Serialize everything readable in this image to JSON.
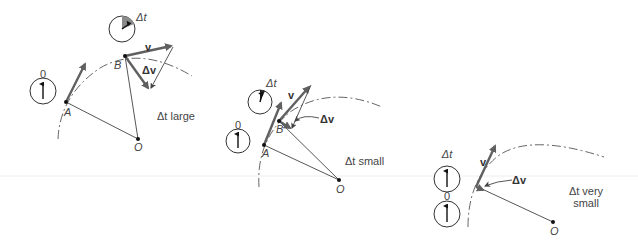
{
  "colors": {
    "vector": "#606060",
    "line": "#444444",
    "sector": "#8a8a8a",
    "text": "#444444"
  },
  "panels": [
    {
      "id": "large",
      "caption": "Δt large",
      "labels": {
        "clock_start": "0",
        "clock_end": "Δt",
        "point_a": "A",
        "point_b": "B",
        "center": "O",
        "velocity": "v",
        "delta_v": "Δv"
      }
    },
    {
      "id": "small",
      "caption": "Δt small",
      "labels": {
        "clock_start": "0",
        "clock_end": "Δt",
        "point_a": "A",
        "point_b": "B",
        "center": "O",
        "velocity": "v",
        "delta_v": "Δv"
      }
    },
    {
      "id": "very-small",
      "caption_line1": "Δt very",
      "caption_line2": "small",
      "labels": {
        "clock_start": "0",
        "clock_end": "Δt",
        "center": "O",
        "velocity": "v",
        "delta_v": "Δv"
      }
    }
  ]
}
